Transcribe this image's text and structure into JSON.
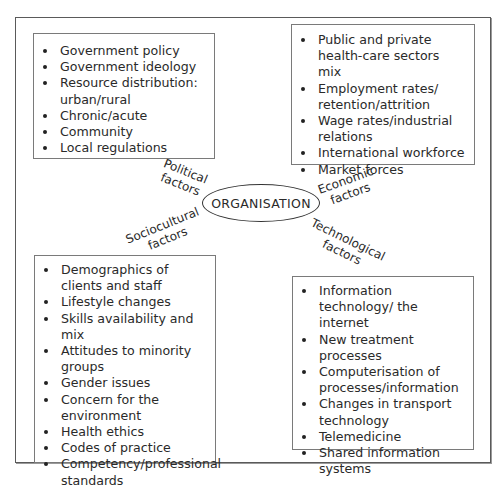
{
  "diagram": {
    "center": {
      "label": "ORGANISATION"
    },
    "factors": [
      {
        "id": "political",
        "label_line1": "Political",
        "label_line2": "factors",
        "items": [
          "Government policy",
          "Government ideology",
          "Resource distribution: urban/rural",
          "Chronic/acute",
          "Community",
          "Local regulations"
        ]
      },
      {
        "id": "economic",
        "label_line1": "Economic",
        "label_line2": "factors",
        "items": [
          "Public and private health-care sectors mix",
          "Employment rates/ retention/attrition",
          "Wage rates/industrial relations",
          "International workforce",
          "Market forces"
        ]
      },
      {
        "id": "sociocultural",
        "label_line1": "Sociocultural",
        "label_line2": "factors",
        "items": [
          "Demographics of clients and staff",
          "Lifestyle changes",
          "Skills availability and mix",
          "Attitudes to minority groups",
          "Gender issues",
          "Concern for the environment",
          "Health ethics",
          "Codes of practice",
          "Competency/professional standards"
        ]
      },
      {
        "id": "technological",
        "label_line1": "Technological",
        "label_line2": "factors",
        "items": [
          "Information technology/ the internet",
          "New treatment processes",
          "Computerisation of processes/information",
          "Changes in transport technology",
          "Telemedicine",
          "Shared information systems"
        ]
      }
    ]
  }
}
